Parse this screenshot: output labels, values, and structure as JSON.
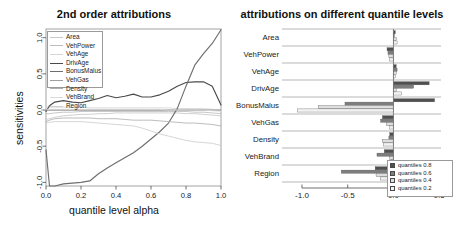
{
  "figure": {
    "background": "#ffffff",
    "width": 456,
    "height": 225
  },
  "left_panel": {
    "title": "2nd order attributions",
    "xlabel": "quantile level alpha",
    "ylabel": "sensitivities",
    "xticks": [
      "0.0",
      "0.2",
      "0.4",
      "0.6",
      "0.8",
      "1.0"
    ],
    "yticks": [
      "1.0",
      "0.5",
      "0.0",
      "-0.5",
      "-1.0"
    ],
    "legend_title": ""
  },
  "right_panel": {
    "title": "attributions on different quantile levels",
    "xticks": [
      "-1.0",
      "-0.5",
      "0.0",
      "0.5"
    ],
    "legend_items": [
      {
        "label": "quantiles 0.8",
        "color": "#4f4f4f"
      },
      {
        "label": "quantiles 0.6",
        "color": "#7d7d7d"
      },
      {
        "label": "quantiles 0.4",
        "color": "#dedede"
      },
      {
        "label": "quantiles 0.2",
        "color": "#f2f2f2"
      }
    ]
  },
  "chart_data": [
    {
      "type": "line",
      "title": "2nd order attributions",
      "xlabel": "quantile level alpha",
      "ylabel": "sensitivities",
      "xlim": [
        0.0,
        1.0
      ],
      "ylim": [
        -1.05,
        1.12
      ],
      "grid": false,
      "legend_position": "top-left",
      "x": [
        0.0,
        0.02,
        0.05,
        0.1,
        0.15,
        0.2,
        0.25,
        0.3,
        0.35,
        0.4,
        0.45,
        0.5,
        0.55,
        0.6,
        0.65,
        0.7,
        0.75,
        0.8,
        0.85,
        0.9,
        0.95,
        1.0
      ],
      "series": [
        {
          "name": "Area",
          "color": "#c8c8c8",
          "values": [
            -0.13,
            -0.12,
            -0.1,
            -0.08,
            -0.07,
            -0.06,
            -0.06,
            -0.05,
            -0.05,
            -0.04,
            -0.04,
            -0.04,
            -0.04,
            -0.04,
            -0.04,
            -0.04,
            -0.04,
            -0.05,
            -0.05,
            -0.06,
            -0.07,
            -0.08
          ]
        },
        {
          "name": "VehPower",
          "color": "#bdbdbd",
          "values": [
            -0.05,
            -0.05,
            -0.04,
            -0.03,
            -0.03,
            -0.02,
            -0.02,
            -0.02,
            -0.02,
            -0.02,
            -0.02,
            -0.02,
            -0.02,
            -0.02,
            -0.02,
            -0.02,
            -0.02,
            -0.02,
            -0.03,
            -0.03,
            -0.04,
            -0.05
          ]
        },
        {
          "name": "VehAge",
          "color": "#d5d5d5",
          "values": [
            0.04,
            0.04,
            0.04,
            0.04,
            0.04,
            0.04,
            0.03,
            0.03,
            0.03,
            0.03,
            0.03,
            0.03,
            0.03,
            0.03,
            0.03,
            0.03,
            0.02,
            0.02,
            0.02,
            0.02,
            0.01,
            0.0
          ]
        },
        {
          "name": "DrivAge",
          "color": "#4a4a4a",
          "values": [
            -0.02,
            0.06,
            0.11,
            0.13,
            0.11,
            0.1,
            0.13,
            0.16,
            0.2,
            0.17,
            0.19,
            0.22,
            0.18,
            0.18,
            0.21,
            0.26,
            0.33,
            0.38,
            0.39,
            0.39,
            0.33,
            0.07
          ]
        },
        {
          "name": "BonusMalus",
          "color": "#6e6e6e",
          "values": [
            -0.55,
            -1.05,
            -1.05,
            -1.02,
            -1.01,
            -1.0,
            -0.98,
            -0.88,
            -0.8,
            -0.73,
            -0.66,
            -0.59,
            -0.5,
            -0.4,
            -0.3,
            -0.18,
            0.02,
            0.33,
            0.62,
            0.78,
            0.92,
            1.11
          ]
        },
        {
          "name": "VehGas",
          "color": "#9e9e9e",
          "values": [
            0.0,
            0.0,
            0.0,
            0.0,
            0.0,
            0.0,
            0.0,
            0.0,
            0.0,
            0.0,
            0.0,
            0.0,
            0.0,
            0.0,
            0.0,
            0.0,
            0.0,
            0.0,
            0.0,
            0.0,
            0.0,
            0.0
          ]
        },
        {
          "name": "Density",
          "color": "#b0b0b0",
          "values": [
            -0.16,
            -0.14,
            -0.12,
            -0.11,
            -0.11,
            -0.11,
            -0.11,
            -0.12,
            -0.12,
            -0.12,
            -0.13,
            -0.14,
            -0.14,
            -0.14,
            -0.15,
            -0.16,
            -0.17,
            -0.18,
            -0.18,
            -0.19,
            -0.2,
            -0.22
          ]
        },
        {
          "name": "VehBrand",
          "color": "#dadada",
          "values": [
            0.01,
            0.01,
            0.01,
            0.01,
            0.01,
            0.01,
            0.01,
            0.01,
            0.01,
            0.01,
            0.01,
            0.01,
            0.01,
            0.01,
            0.01,
            0.0,
            0.0,
            0.0,
            0.0,
            0.0,
            -0.01,
            -0.02
          ]
        },
        {
          "name": "Region",
          "color": "#cfcfcf",
          "values": [
            -0.18,
            -0.17,
            -0.16,
            -0.16,
            -0.16,
            -0.16,
            -0.17,
            -0.18,
            -0.19,
            -0.2,
            -0.21,
            -0.22,
            -0.25,
            -0.29,
            -0.33,
            -0.36,
            -0.39,
            -0.42,
            -0.44,
            -0.45,
            -0.46,
            -0.49
          ]
        }
      ]
    },
    {
      "type": "bar",
      "orientation": "horizontal",
      "title": "attributions on different quantile levels",
      "xlabel": "",
      "ylabel": "",
      "xlim": [
        -1.12,
        0.52
      ],
      "grid": false,
      "legend_position": "bottom-right",
      "categories": [
        "Area",
        "VehPower",
        "VehAge",
        "DrivAge",
        "BonusMalus",
        "VehGas",
        "Density",
        "VehBrand",
        "Region"
      ],
      "series": [
        {
          "name": "quantiles 0.8",
          "color": "#4f4f4f",
          "values": [
            0.02,
            -0.07,
            0.03,
            0.39,
            0.45,
            -0.12,
            -0.04,
            -0.1,
            -0.2
          ]
        },
        {
          "name": "quantiles 0.6",
          "color": "#7d7d7d",
          "values": [
            0.01,
            -0.06,
            0.04,
            0.22,
            -0.53,
            -0.14,
            -0.05,
            -0.18,
            -0.57
          ]
        },
        {
          "name": "quantiles 0.4",
          "color": "#dedede",
          "values": [
            0.03,
            -0.05,
            0.03,
            0.03,
            -0.82,
            -0.08,
            -0.12,
            -0.04,
            -0.19
          ]
        },
        {
          "name": "quantiles 0.2",
          "color": "#f2f2f2",
          "values": [
            0.04,
            -0.04,
            0.02,
            0.09,
            -1.05,
            -0.04,
            -0.11,
            -0.02,
            -0.14
          ]
        }
      ]
    }
  ]
}
